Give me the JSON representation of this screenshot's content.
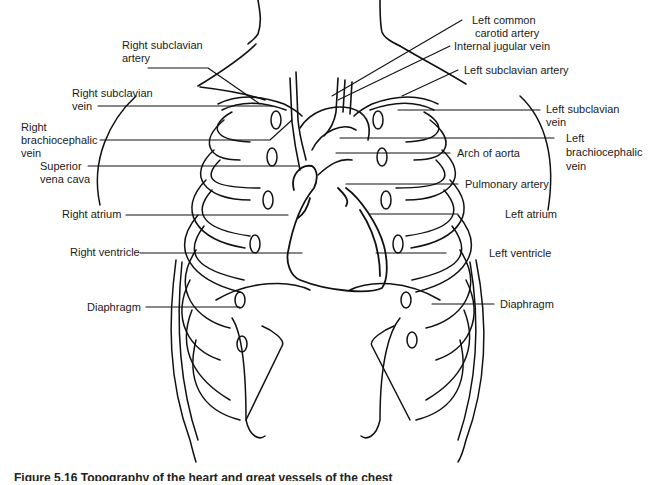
{
  "figure": {
    "caption": "Figure 5.16 Topography of the heart and great vessels of the chest",
    "line_color": "#111111",
    "background": "#ffffff"
  },
  "labels": {
    "left": [
      {
        "id": "right-subclavian-artery",
        "line1": "Right subclavian",
        "line2": "artery"
      },
      {
        "id": "right-subclavian-vein",
        "line1": "Right subclavian",
        "line2": "vein"
      },
      {
        "id": "right-brachiocephalic-vein",
        "line1": "Right",
        "line2": "brachiocephalic",
        "line3": "vein"
      },
      {
        "id": "superior-vena-cava",
        "line1": "Superior",
        "line2": "vena cava"
      },
      {
        "id": "right-atrium",
        "line1": "Right atrium"
      },
      {
        "id": "right-ventricle",
        "line1": "Right ventricle"
      },
      {
        "id": "diaphragm-right",
        "line1": "Diaphragm"
      }
    ],
    "right": [
      {
        "id": "left-common-carotid-artery",
        "line1": "Left common",
        "line2": "carotid artery"
      },
      {
        "id": "internal-jugular-vein",
        "line1": "Internal jugular vein"
      },
      {
        "id": "left-subclavian-artery",
        "line1": "Left subclavian artery"
      },
      {
        "id": "left-subclavian-vein",
        "line1": "Left subclavian",
        "line2": "vein"
      },
      {
        "id": "left-brachiocephalic-vein",
        "line1": "Left",
        "line2": "brachiocephalic",
        "line3": "vein"
      },
      {
        "id": "arch-of-aorta",
        "line1": "Arch of aorta"
      },
      {
        "id": "pulmonary-artery",
        "line1": "Pulmonary artery"
      },
      {
        "id": "left-atrium",
        "line1": "Left atrium"
      },
      {
        "id": "left-ventricle",
        "line1": "Left ventricle"
      },
      {
        "id": "diaphragm-left",
        "line1": "Diaphragm"
      }
    ]
  }
}
